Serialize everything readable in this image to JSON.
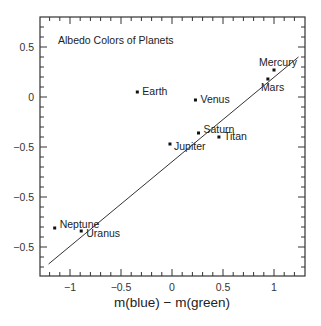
{
  "chart_data": {
    "type": "scatter",
    "title": "Albedo Colors of Planets",
    "xlabel": "m(blue) − m(green)",
    "ylabel": "",
    "xlim": [
      -1.3,
      1.3
    ],
    "ylim": [
      -1.78,
      0.8
    ],
    "grid": false,
    "legend": null,
    "x_ticks": [
      -1,
      -0.5,
      0,
      0.5,
      1
    ],
    "x_tick_labels": [
      "−1",
      "−0.5",
      "0",
      "0.5",
      "1"
    ],
    "y_ticks": [
      0.5,
      0,
      -0.5,
      -1.0,
      -1.5
    ],
    "y_tick_labels": [
      "0.5",
      "0",
      "−0.5",
      "−0.5",
      "−0.5"
    ],
    "points": [
      {
        "name": "Earth",
        "x": -0.34,
        "y": 0.05
      },
      {
        "name": "Venus",
        "x": 0.23,
        "y": -0.03
      },
      {
        "name": "Mercury",
        "x": 1.0,
        "y": 0.27
      },
      {
        "name": "Mars",
        "x": 0.94,
        "y": 0.18
      },
      {
        "name": "Saturn",
        "x": 0.26,
        "y": -0.36
      },
      {
        "name": "Titan",
        "x": 0.46,
        "y": -0.4
      },
      {
        "name": "Jupiter",
        "x": -0.02,
        "y": -0.47
      },
      {
        "name": "Neptune",
        "x": -1.15,
        "y": -1.31
      },
      {
        "name": "Uranus",
        "x": -0.89,
        "y": -1.34
      }
    ],
    "fit_line": {
      "x": [
        -1.21,
        1.24
      ],
      "y": [
        -1.67,
        0.4
      ]
    },
    "colors": {
      "axis": "#333333",
      "points": "#111111",
      "line": "#333333",
      "background": "#ffffff"
    }
  }
}
